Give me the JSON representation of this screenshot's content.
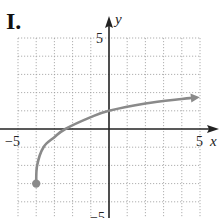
{
  "panel_label": "I.",
  "chart_data": {
    "type": "line",
    "title": "I.",
    "xlabel": "x",
    "ylabel": "y",
    "xlim": [
      -5,
      5
    ],
    "ylim": [
      -5,
      5
    ],
    "grid": true,
    "grid_step": 1,
    "tick_labels": {
      "x": [
        "-5",
        "5"
      ],
      "y": [
        "5",
        "-5"
      ]
    },
    "series": [
      {
        "name": "curve",
        "color": "#808080",
        "start_point": {
          "x": -4,
          "y": -3,
          "marker": "filled-circle"
        },
        "end": "arrow",
        "x": [
          -4,
          -3.95,
          -3.6,
          -3,
          -2.4,
          -1,
          0,
          2,
          4,
          4.5
        ],
        "y": [
          -3,
          -2,
          -1,
          -0.45,
          0,
          0.65,
          1,
          1.4,
          1.65,
          1.7
        ]
      }
    ]
  },
  "labels": {
    "x_neg": "−5",
    "x_pos": "5",
    "y_pos": "5",
    "y_neg": "−5",
    "x_axis": "x",
    "y_axis": "y"
  }
}
